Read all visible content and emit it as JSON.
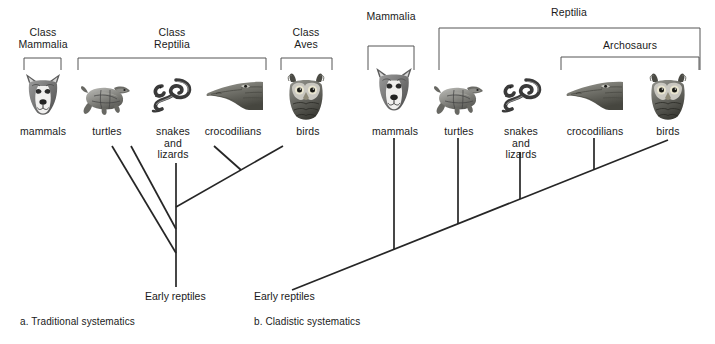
{
  "figure": {
    "background_color": "#ffffff",
    "line_color": "#262626",
    "bracket_color": "#555555",
    "text_color": "#1a1a1a"
  },
  "panels": [
    {
      "id": "a",
      "caption": "a. Traditional systematics",
      "root_label": "Early reptiles",
      "groups": [
        {
          "name": "class-mammalia",
          "label": "Class\nMammalia"
        },
        {
          "name": "class-reptilia",
          "label": "Class\nReptilia"
        },
        {
          "name": "class-aves",
          "label": "Class\nAves"
        }
      ],
      "taxa": [
        {
          "name": "mammals",
          "label": "mammals",
          "icon": "dog-head-icon"
        },
        {
          "name": "turtles",
          "label": "turtles",
          "icon": "turtle-icon"
        },
        {
          "name": "snakes-and-lizards",
          "label": "snakes\nand\nlizards",
          "icon": "snake-icon"
        },
        {
          "name": "crocodilians",
          "label": "crocodilians",
          "icon": "crocodile-head-icon"
        },
        {
          "name": "birds",
          "label": "birds",
          "icon": "owl-head-icon"
        }
      ]
    },
    {
      "id": "b",
      "caption": "b. Cladistic systematics",
      "root_label": "Early reptiles",
      "groups": [
        {
          "name": "mammalia",
          "label": "Mammalia"
        },
        {
          "name": "reptilia",
          "label": "Reptilia"
        },
        {
          "name": "archosaurs",
          "label": "Archosaurs"
        }
      ],
      "taxa": [
        {
          "name": "mammals",
          "label": "mammals",
          "icon": "dog-head-icon"
        },
        {
          "name": "turtles",
          "label": "turtles",
          "icon": "turtle-icon"
        },
        {
          "name": "snakes-and-lizards",
          "label": "snakes\nand\nlizards",
          "icon": "snake-icon"
        },
        {
          "name": "crocodilians",
          "label": "crocodilians",
          "icon": "crocodile-head-icon"
        },
        {
          "name": "birds",
          "label": "birds",
          "icon": "owl-head-icon"
        }
      ]
    }
  ]
}
